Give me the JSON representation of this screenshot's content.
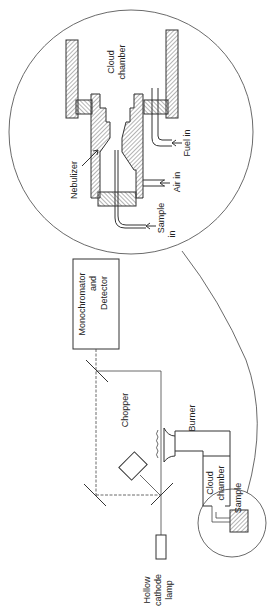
{
  "diagram": {
    "type": "atomic absorption spectrometer schematic (rotated 90°)",
    "components": {
      "lamp": {
        "label_lines": [
          "Hollow",
          "cathode",
          "lamp"
        ]
      },
      "chopper": {
        "label": "Chopper"
      },
      "burner": {
        "label": "Burner"
      },
      "monochromator": {
        "label_lines": [
          "Monochromator",
          "and",
          "Detector"
        ]
      },
      "cloud_chamber_small": {
        "label_lines": [
          "Cloud",
          "chamber"
        ]
      },
      "sample_small": {
        "label": "Sample"
      }
    },
    "inset": {
      "cloud_chamber": {
        "label_lines": [
          "Cloud",
          "chamber"
        ]
      },
      "nebulizer": {
        "label": "Nebulizer"
      },
      "fuel_in": {
        "label": "Fuel in"
      },
      "air_in": {
        "label": "Air in"
      },
      "sample_in": {
        "label_lines": [
          "Sample",
          "in"
        ]
      }
    },
    "colors": {
      "line": "#333333",
      "background": "#ffffff"
    }
  }
}
